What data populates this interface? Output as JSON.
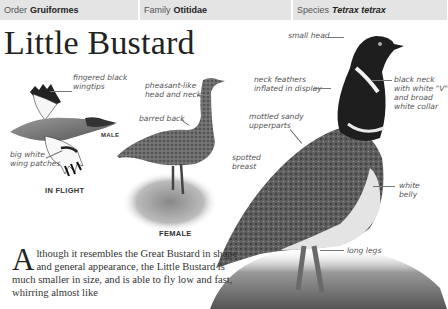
{
  "header": {
    "cells": [
      {
        "label": "Order",
        "value": "Gruiformes",
        "italic": false
      },
      {
        "label": "Family",
        "value": "Otitidae",
        "italic": false
      },
      {
        "label": "Species",
        "value": "Tetrax tetrax",
        "italic": true
      }
    ]
  },
  "page": {
    "title": "Little Bustard"
  },
  "illustrations": {
    "flight": {
      "label": "IN FLIGHT",
      "sex_label": "MALE",
      "callouts": [
        "fingered black\nwingtips",
        "big white\nwing patches"
      ]
    },
    "female": {
      "label": "FEMALE",
      "callouts": [
        "pheasant-like\nhead and neck",
        "barred back",
        "spotted\nbreast"
      ]
    },
    "male": {
      "callouts": [
        "small head",
        "neck feathers\ninflated in display",
        "black neck\nwith white \"V\"\nand broad\nwhite collar",
        "mottled sandy\nupperparts",
        "white\nbelly",
        "long legs"
      ]
    }
  },
  "body": {
    "drop_cap": "A",
    "text": "lthough it resembles the Great Bustard in shape and general appearance, the Little Bustard is much smaller in size, and is able to fly low and fast, whirring almost like"
  }
}
